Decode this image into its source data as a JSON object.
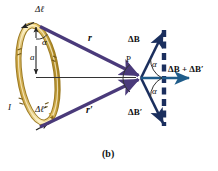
{
  "figure": {
    "caption": "(b)",
    "colors": {
      "loop_wire": "#f2d98a",
      "loop_wire_edge": "#b99436",
      "r_vector": "#4a3a7a",
      "B_vector": "#1b2f5e",
      "resultant": "#1f5c8a",
      "axis_line": "#333333",
      "background": "#ffffff"
    },
    "labels": {
      "delta_l": "Δℓ",
      "delta_l_prime": "Δℓ′",
      "alpha_top": "α",
      "radius_a": "a",
      "current_I": "I",
      "r": "r",
      "r_prime": "r′",
      "point_P": "P",
      "delta_B": "ΔB",
      "delta_B_prime": "ΔB′",
      "alpha_upper": "α",
      "alpha_lower": "α",
      "resultant": "ΔB + ΔB′"
    }
  }
}
